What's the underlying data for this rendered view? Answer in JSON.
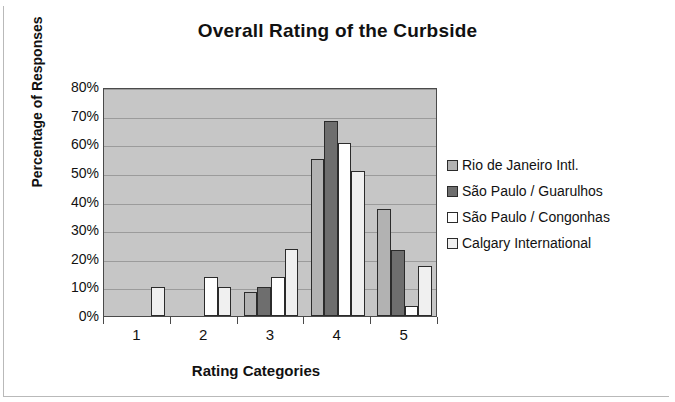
{
  "chart_data": {
    "type": "bar",
    "title": "Overall Rating of the Curbside",
    "xlabel": "Rating Categories",
    "ylabel": "Percentage of Responses",
    "categories": [
      "1",
      "2",
      "3",
      "4",
      "5"
    ],
    "ylim": [
      0,
      80
    ],
    "ytick_labels": [
      "80%",
      "70%",
      "60%",
      "50%",
      "40%",
      "30%",
      "20%",
      "10%",
      "0%"
    ],
    "ytick_values": [
      80,
      70,
      60,
      50,
      40,
      30,
      20,
      10,
      0
    ],
    "grid": true,
    "legend_position": "right",
    "series": [
      {
        "name": "Rio de Janeiro Intl.",
        "color": "#b2b2b2",
        "values": [
          0,
          0,
          8.5,
          55,
          37.5
        ]
      },
      {
        "name": "São Paulo / Guarulhos",
        "color": "#6e6e6e",
        "values": [
          0,
          0,
          10,
          68,
          23
        ]
      },
      {
        "name": "São Paulo / Congonhas",
        "color": "#ffffff",
        "values": [
          0,
          13.5,
          13.5,
          60.5,
          3.5
        ]
      },
      {
        "name": "Calgary International",
        "color": "#f0f0f0",
        "values": [
          10,
          10,
          23.5,
          50.5,
          17.5
        ]
      }
    ]
  },
  "figure": {
    "plot_background": "#c6c6c6",
    "gridline_color": "#9b9b9b",
    "axis_color": "#4a4a4a"
  }
}
